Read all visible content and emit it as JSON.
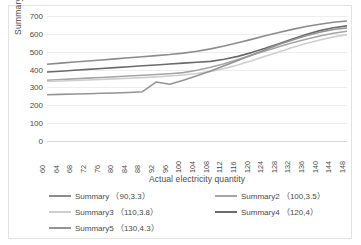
{
  "chart_data": {
    "type": "line",
    "title": "",
    "xlabel": "Actual electricity quantity",
    "ylabel": "Summary",
    "categories": [
      60,
      64,
      68,
      72,
      76,
      80,
      84,
      88,
      92,
      96,
      100,
      104,
      108,
      112,
      116,
      120,
      124,
      128,
      132,
      136,
      140,
      144,
      148
    ],
    "xlim": [
      60,
      148
    ],
    "ylim": [
      0,
      700
    ],
    "yticks": [
      0,
      100,
      200,
      300,
      400,
      500,
      600,
      700
    ],
    "grid": true,
    "legend_position": "bottom",
    "series": [
      {
        "name": "Summary",
        "param": "（90,3.3）",
        "label": "Summary （90,3.3）",
        "color": "#8c8c8c",
        "values": [
          430,
          436,
          442,
          448,
          454,
          460,
          466,
          472,
          478,
          484,
          492,
          503,
          516,
          532,
          550,
          569,
          589,
          608,
          625,
          641,
          654,
          665,
          672
        ]
      },
      {
        "name": "Summary2",
        "param": "（100,3.5）",
        "label": "Summary2 （100,3.5）",
        "color": "#a6a6a6",
        "values": [
          340,
          344,
          348,
          352,
          356,
          360,
          364,
          368,
          372,
          377,
          383,
          396,
          413,
          433,
          456,
          480,
          504,
          528,
          550,
          570,
          588,
          603,
          615
        ]
      },
      {
        "name": "Summary3",
        "param": "（110,3.8）",
        "label": "Summary3 （110,3.8）",
        "color": "#cfcfcf",
        "values": [
          333,
          336,
          339,
          342,
          345,
          348,
          351,
          355,
          359,
          364,
          370,
          378,
          390,
          406,
          426,
          449,
          474,
          499,
          523,
          546,
          566,
          583,
          596
        ]
      },
      {
        "name": "Summary4",
        "param": "（120,4）",
        "label": "Summary4 （120,4）",
        "color": "#6b6b6b",
        "values": [
          386,
          391,
          396,
          401,
          406,
          411,
          416,
          421,
          426,
          431,
          436,
          441,
          446,
          458,
          474,
          495,
          519,
          545,
          571,
          596,
          618,
          634,
          645
        ]
      },
      {
        "name": "Summary5",
        "param": "（130,4.3）",
        "label": "Summary5 （130,4.3）",
        "color": "#949494",
        "values": [
          259,
          261,
          263,
          265,
          267,
          269,
          272,
          276,
          330,
          318,
          340,
          365,
          392,
          421,
          451,
          481,
          511,
          540,
          566,
          589,
          609,
          624,
          633
        ]
      }
    ]
  }
}
